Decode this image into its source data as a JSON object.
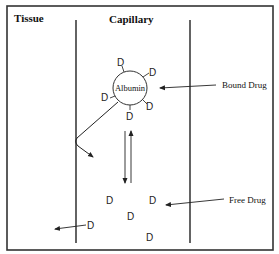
{
  "diagram": {
    "regions": {
      "tissue": "Tissue",
      "capillary": "Capillary"
    },
    "protein": "Albumin",
    "drug_symbol": "D",
    "labels": {
      "bound": "Bound Drug",
      "free": "Free Drug"
    },
    "bound_drug_count": 5,
    "free_drug_count": 4,
    "leaking_drug_count": 1,
    "colors": {
      "line": "#222222",
      "frame": "#333333",
      "text": "#111111"
    }
  }
}
